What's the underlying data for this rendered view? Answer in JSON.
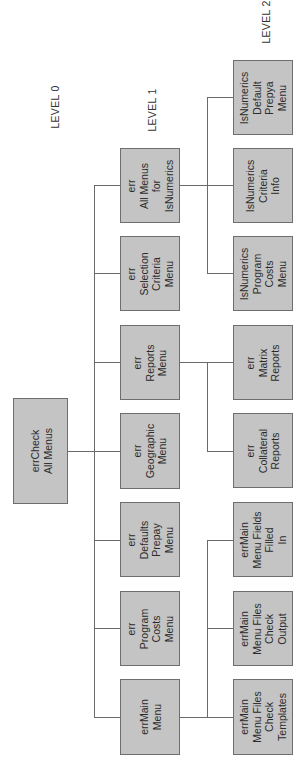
{
  "diagram": {
    "orientation": "rotated-90-ccw",
    "colors": {
      "box_fill": "#c4c4c4",
      "box_border": "#6e6e6e",
      "line": "#6a6a6a",
      "text": "#2b2b2b"
    },
    "levels": [
      {
        "label": "LEVEL 0"
      },
      {
        "label": "LEVEL 1"
      },
      {
        "label": "LEVEL 2"
      }
    ],
    "root": {
      "id": "errCheckAllMenus",
      "label": "errCheck\nAll Menus"
    },
    "level1": [
      {
        "id": "l1_allmenus_isnumerics",
        "label": "err\nAll Menus\nfor\nIsNumerics"
      },
      {
        "id": "l1_selection_criteria",
        "label": "err\nSelection\nCriteria\nMenu"
      },
      {
        "id": "l1_reports",
        "label": "err\nReports\nMenu"
      },
      {
        "id": "l1_geographic",
        "label": "err\nGeographic\nMenu"
      },
      {
        "id": "l1_defaults_prepay",
        "label": "err\nDefaults\nPrepay\nMenu"
      },
      {
        "id": "l1_program_costs",
        "label": "err\nProgram\nCosts\nMenu"
      },
      {
        "id": "l1_main_menu",
        "label": "errMain\nMenu"
      }
    ],
    "level2": [
      {
        "id": "l2_isn_default_prepya",
        "parent": "l1_allmenus_isnumerics",
        "label": "IsNumerics\nDefault\nPrepya\nMenu"
      },
      {
        "id": "l2_isn_criteria_info",
        "parent": "l1_allmenus_isnumerics",
        "label": "IsNumerics\nCriteria\nInfo"
      },
      {
        "id": "l2_isn_program_costs",
        "parent": "l1_allmenus_isnumerics",
        "label": "IsNumerics\nProgram\nCosts\nMenu"
      },
      {
        "id": "l2_matrix_reports",
        "parent": "l1_reports",
        "label": "err\nMatrix\nReports"
      },
      {
        "id": "l2_collateral_reports",
        "parent": "l1_reports",
        "label": "err\nCollateral\nReports"
      },
      {
        "id": "l2_fields_filled_in",
        "parent": "l1_main_menu",
        "label": "errMain\nMenu Fields\nFilled\nIn"
      },
      {
        "id": "l2_files_check_output",
        "parent": "l1_main_menu",
        "label": "errMain\nMenu Files\nCheck\nOutput"
      },
      {
        "id": "l2_files_check_templates",
        "parent": "l1_main_menu",
        "label": "errMain\nMenu Files\nCheck\nTemplates"
      }
    ]
  }
}
